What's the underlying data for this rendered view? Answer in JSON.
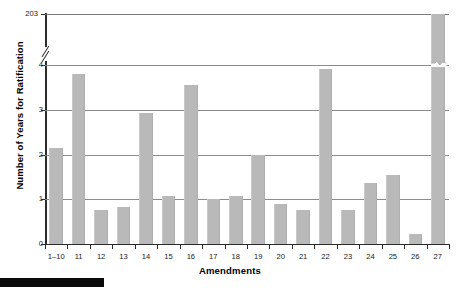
{
  "chart_data": {
    "type": "bar",
    "title": "",
    "xlabel": "Amendments",
    "ylabel": "Number of Years for Ratification",
    "categories": [
      "1–10",
      "11",
      "12",
      "13",
      "14",
      "15",
      "16",
      "17",
      "18",
      "19",
      "20",
      "21",
      "22",
      "23",
      "24",
      "25",
      "26",
      "27"
    ],
    "values": [
      2.15,
      3.8,
      0.75,
      0.82,
      2.93,
      1.07,
      3.55,
      1.0,
      1.07,
      2.0,
      0.9,
      0.75,
      3.9,
      0.75,
      1.37,
      1.55,
      0.22,
      203
    ],
    "ytick_labels": [
      "0",
      "1",
      "2",
      "3",
      "4",
      "203"
    ],
    "ytick_values": [
      0,
      1,
      2,
      3,
      4,
      203
    ],
    "ylim": [
      0,
      203
    ],
    "axis_break": {
      "present": true,
      "between": [
        4,
        203
      ],
      "note": "y-axis broken between 4 and 203"
    },
    "grid": true,
    "gridlines_at": [
      1,
      2,
      3,
      4,
      203
    ],
    "legend": "none",
    "bar_color": "#b9b9b9",
    "axis_color": "#2b2b2b",
    "grid_color": "#8c8c8c",
    "background": "#ffffff",
    "annotations": [
      "bar for amendment 27 is truncated with a zigzag break mark above the 4 gridline"
    ]
  },
  "ylabel_text": "Number of Years for Ratification",
  "xlabel_text": "Amendments"
}
